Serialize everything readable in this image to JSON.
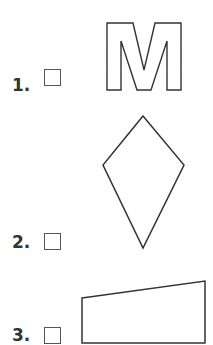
{
  "items": [
    {
      "number": "1.",
      "shape": "letter-m",
      "checked": false
    },
    {
      "number": "2.",
      "shape": "kite",
      "checked": false
    },
    {
      "number": "3.",
      "shape": "trapezoid",
      "checked": false
    }
  ],
  "colors": {
    "stroke": "#333333",
    "checkbox_border": "#555555",
    "background": "#ffffff"
  }
}
